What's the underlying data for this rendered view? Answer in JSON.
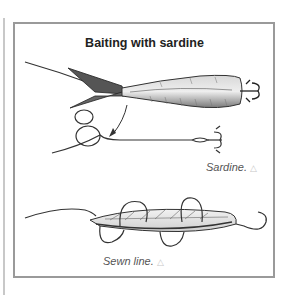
{
  "figure": {
    "title": "Baiting with sardine",
    "captions": [
      {
        "label": "Sardine.",
        "icon": "warning-triangle-icon",
        "glyph": "△"
      },
      {
        "label": "Sewn line.",
        "icon": "warning-triangle-icon",
        "glyph": "△"
      }
    ]
  },
  "colors": {
    "frame": "#9a9a9a",
    "line": "#3a3a3a",
    "fish_body": "#b8b8b8",
    "caption_text": "#555555"
  }
}
